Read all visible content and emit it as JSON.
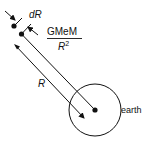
{
  "diagram": {
    "labels": {
      "dR": "dR",
      "force_numerator": "GMeM",
      "force_denominator": "R",
      "force_denominator_exp": "2",
      "distance": "R",
      "earth": "earth"
    },
    "colors": {
      "ink": "#111111",
      "background": "#ffffff"
    }
  }
}
